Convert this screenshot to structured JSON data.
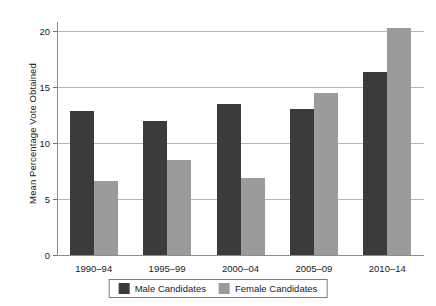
{
  "chart_data": {
    "type": "bar",
    "title": "",
    "xlabel": "",
    "ylabel": "Mean Percentage Vote Obtained",
    "categories": [
      "1990–94",
      "1995–99",
      "2000–04",
      "2005–09",
      "2010–14"
    ],
    "series": [
      {
        "name": "Male Candidates",
        "color": "#3b3b3b",
        "values": [
          12.9,
          12.0,
          13.5,
          13.0,
          16.3
        ]
      },
      {
        "name": "Female Candidates",
        "color": "#9b9b9b",
        "values": [
          6.6,
          8.5,
          6.9,
          14.5,
          20.3
        ]
      }
    ],
    "ylim": [
      0,
      20.8
    ],
    "yticks": [
      0,
      5,
      10,
      15,
      20
    ],
    "ytick_labels": [
      "0",
      "5",
      "10",
      "15",
      "20"
    ],
    "grid": true,
    "legend_position": "bottom-center",
    "legend_entries": [
      "Male Candidates",
      "Female Candidates"
    ]
  }
}
